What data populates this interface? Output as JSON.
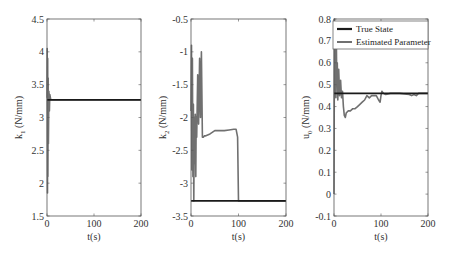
{
  "figure": {
    "colors": {
      "true_state": "#1a1a1a",
      "estimated": "#707070",
      "axis": "#555555"
    },
    "legend": {
      "items": [
        "True State",
        "Estimated Parameter"
      ]
    }
  },
  "chart_data": [
    {
      "type": "line",
      "title": "",
      "xlabel": "t(s)",
      "ylabel": "k1 (N/mm)",
      "ylabel_main": "k",
      "ylabel_sub": "1",
      "ylabel_unit": " (N/mm)",
      "xlim": [
        0,
        200
      ],
      "ylim": [
        1.5,
        4.5
      ],
      "xticks": [
        0,
        100,
        200
      ],
      "xtick_labels": [
        "0",
        "100",
        "200"
      ],
      "yticks": [
        1.5,
        2,
        2.5,
        3,
        3.5,
        4,
        4.5
      ],
      "ytick_labels": [
        "1.5",
        "2",
        "2.5",
        "3",
        "3.5",
        "4",
        "4.5"
      ],
      "grid": false,
      "series": [
        {
          "name": "True State",
          "x": [
            0,
            200
          ],
          "y": [
            3.27,
            3.27
          ]
        },
        {
          "name": "Estimated Parameter",
          "x": [
            0,
            0.5,
            1,
            1.5,
            2,
            2.5,
            3,
            4,
            5,
            6,
            8,
            10,
            100,
            200
          ],
          "y": [
            3.3,
            4.05,
            1.85,
            3.9,
            2.1,
            3.6,
            2.6,
            3.4,
            3.1,
            3.35,
            3.27,
            3.27,
            3.27,
            3.27
          ]
        }
      ]
    },
    {
      "type": "line",
      "title": "",
      "xlabel": "t(s)",
      "ylabel": "k2 (N/mm)",
      "ylabel_main": "k",
      "ylabel_sub": "2",
      "ylabel_unit": " (N/mm)",
      "xlim": [
        0,
        200
      ],
      "ylim": [
        -3.5,
        -0.5
      ],
      "xticks": [
        0,
        100,
        200
      ],
      "xtick_labels": [
        "0",
        "100",
        "200"
      ],
      "yticks": [
        -3.5,
        -3,
        -2.5,
        -2,
        -1.5,
        -1,
        -0.5
      ],
      "ytick_labels": [
        "-3.5",
        "-3",
        "-2.5",
        "-2",
        "-1.5",
        "-1",
        "-0.5"
      ],
      "grid": false,
      "series": [
        {
          "name": "True State",
          "x": [
            0,
            200
          ],
          "y": [
            -3.27,
            -3.27
          ]
        },
        {
          "name": "Estimated Parameter",
          "x": [
            0,
            1,
            2,
            3,
            4,
            5,
            6,
            7,
            8,
            9,
            10,
            11,
            12,
            14,
            16,
            18,
            20,
            22,
            24,
            26,
            28,
            30,
            40,
            50,
            60,
            70,
            80,
            90,
            95,
            98,
            100,
            102,
            200
          ],
          "y": [
            -1.9,
            -0.9,
            -2.8,
            -1.1,
            -2.9,
            -1.8,
            -3.27,
            -2.0,
            -2.7,
            -1.95,
            -2.9,
            -2.0,
            -2.3,
            -1.35,
            -2.1,
            -1.1,
            -2.0,
            -1.0,
            -2.3,
            -2.3,
            -2.28,
            -2.28,
            -2.25,
            -2.2,
            -2.2,
            -2.2,
            -2.19,
            -2.18,
            -2.18,
            -2.3,
            -3.27,
            -3.27,
            -3.27
          ]
        }
      ]
    },
    {
      "type": "line",
      "title": "",
      "xlabel": "t(s)",
      "ylabel": "u0 (N/mm)",
      "ylabel_main": "u",
      "ylabel_sub": "0",
      "ylabel_unit": " (N/mm)",
      "xlim": [
        0,
        200
      ],
      "ylim": [
        -0.1,
        0.8
      ],
      "xticks": [
        0,
        100,
        200
      ],
      "xtick_labels": [
        "0",
        "100",
        "200"
      ],
      "yticks": [
        -0.1,
        0,
        0.1,
        0.2,
        0.3,
        0.4,
        0.5,
        0.6,
        0.7,
        0.8
      ],
      "ytick_labels": [
        "-0.1",
        "0",
        "0.1",
        "0.2",
        "0.3",
        "0.4",
        "0.5",
        "0.6",
        "0.7",
        "0.8"
      ],
      "grid": false,
      "legend": {
        "position": "upper-right",
        "entries": [
          "True State",
          "Estimated Parameter"
        ]
      },
      "series": [
        {
          "name": "True State",
          "x": [
            0,
            200
          ],
          "y": [
            0.46,
            0.46
          ]
        },
        {
          "name": "Estimated Parameter",
          "x": [
            0,
            1,
            2,
            3,
            4,
            5,
            6,
            7,
            8,
            10,
            12,
            14,
            16,
            18,
            20,
            22,
            24,
            26,
            30,
            35,
            40,
            45,
            50,
            55,
            60,
            65,
            70,
            75,
            80,
            90,
            95,
            98,
            100,
            102,
            105,
            110,
            120,
            140,
            160,
            165,
            170,
            175,
            180,
            200
          ],
          "y": [
            0.0,
            0.8,
            0.45,
            0.75,
            0.44,
            0.68,
            0.5,
            0.6,
            0.43,
            0.57,
            0.45,
            0.52,
            0.44,
            0.47,
            0.4,
            0.36,
            0.35,
            0.37,
            0.38,
            0.38,
            0.39,
            0.39,
            0.4,
            0.41,
            0.42,
            0.43,
            0.45,
            0.44,
            0.45,
            0.45,
            0.43,
            0.42,
            0.45,
            0.47,
            0.46,
            0.455,
            0.46,
            0.46,
            0.455,
            0.45,
            0.455,
            0.45,
            0.46,
            0.46
          ]
        }
      ]
    }
  ]
}
